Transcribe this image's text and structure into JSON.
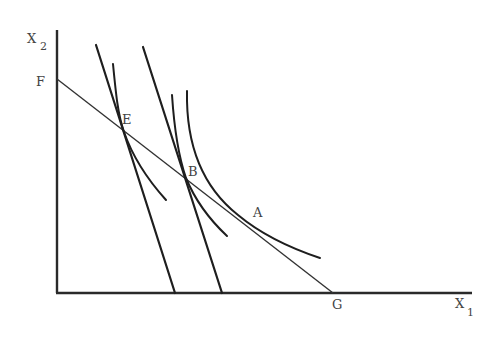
{
  "figure": {
    "type": "indifference-curve diagram",
    "axes": {
      "y_label": "X",
      "y_label_sub": "2",
      "x_label": "X",
      "x_label_sub": "1"
    },
    "points": {
      "F": "F",
      "E": "E",
      "B": "B",
      "A": "A",
      "G": "G"
    },
    "elements": [
      {
        "name": "budget-line-FG",
        "kind": "straight line",
        "from": "F",
        "to": "G"
      },
      {
        "name": "steep-price-line-1",
        "kind": "straight line",
        "through": "E"
      },
      {
        "name": "steep-price-line-2",
        "kind": "straight line",
        "through": "B"
      },
      {
        "name": "indifference-curve-E",
        "kind": "convex curve",
        "tangent_at": "E"
      },
      {
        "name": "indifference-curve-B",
        "kind": "convex curve",
        "tangent_at": "B"
      },
      {
        "name": "indifference-curve-A",
        "kind": "convex curve",
        "tangent_at": "A"
      }
    ],
    "colors": {
      "lines": "#1e1e1e",
      "labels": "#444444",
      "background": "#ffffff"
    }
  }
}
